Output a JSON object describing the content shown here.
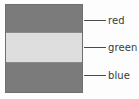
{
  "figure": {
    "title": "",
    "background_color": "#fdfdfd",
    "outline_color": "#6f6f6f",
    "label_text_color": "#3a3a3a",
    "leader_line_color": "#4a4a4a"
  },
  "chart_data": {
    "type": "bar",
    "title": "",
    "xlabel": "",
    "ylabel": "",
    "orientation": "stacked-vertical",
    "categories": [
      "red",
      "green",
      "blue"
    ],
    "values": [
      1,
      1,
      1
    ],
    "annotations": [
      "red",
      "green",
      "blue"
    ],
    "series": [
      {
        "name": "channels",
        "values": [
          1,
          1,
          1
        ]
      }
    ],
    "legend_position": "right-callouts",
    "grid": false
  },
  "bands": [
    {
      "id": "red",
      "label": "red",
      "fill_color": "#7b7b7b",
      "order": 1
    },
    {
      "id": "green",
      "label": "green",
      "fill_color": "#dedede",
      "order": 2
    },
    {
      "id": "blue",
      "label": "blue",
      "fill_color": "#7b7b7b",
      "order": 3
    }
  ],
  "labels": {
    "red": "red",
    "green": "green",
    "blue": "blue"
  }
}
